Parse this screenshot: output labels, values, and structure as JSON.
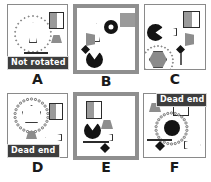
{
  "figure": {
    "type": "panel-grid",
    "rows": 2,
    "cols": 3,
    "background": "#ffffff",
    "colors": {
      "panel_border_thin": "#8a8a8a",
      "panel_border_thick": "#8f8f8f",
      "banner_bg": "#3d3d3d",
      "banner_text": "#ffffff",
      "shape_dark": "#141414",
      "shape_gray": "#9a9a9a"
    }
  },
  "panels": [
    {
      "id": "A",
      "letter": "A",
      "border": "thin",
      "banner": "Not rotated",
      "objects": [
        "dial-ring-of-circles",
        "white-triangle-needle",
        "half-gray-square",
        "gray-trapezoid",
        "dark-bar"
      ]
    },
    {
      "id": "B",
      "letter": "B",
      "border": "thick",
      "banner": "",
      "objects": [
        "white-triangle-needle",
        "black-donut",
        "gray-trapezoid",
        "gray-half-square",
        "black-diamond",
        "black-pacman"
      ]
    },
    {
      "id": "C",
      "letter": "C",
      "border": "thin",
      "banner": "",
      "objects": [
        "black-pacman",
        "white-arrow-left",
        "half-gray-square",
        "gray-trapezoid-flag",
        "black-diamond",
        "gray-stick",
        "dial-ring-of-circles",
        "gray-hexagon"
      ]
    },
    {
      "id": "D",
      "letter": "D",
      "border": "thin",
      "banner": "Dead end",
      "objects": [
        "dial-ring-of-circles",
        "white-pentagon",
        "gray-trapezoid",
        "half-gray-square",
        "white-arrow-left"
      ]
    },
    {
      "id": "E",
      "letter": "E",
      "border": "thick",
      "banner": "",
      "objects": [
        "half-gray-square",
        "gray-trapezoid",
        "black-pacman",
        "white-arrow-left",
        "dark-bar",
        "black-diamond"
      ]
    },
    {
      "id": "F",
      "letter": "F",
      "border": "thin",
      "banner": "Dead end",
      "objects": [
        "gray-trapezoid",
        "half-gray-square",
        "dial-ring-of-circles",
        "black-circle",
        "dark-bar",
        "black-diamond",
        "white-arrow-right"
      ]
    }
  ]
}
